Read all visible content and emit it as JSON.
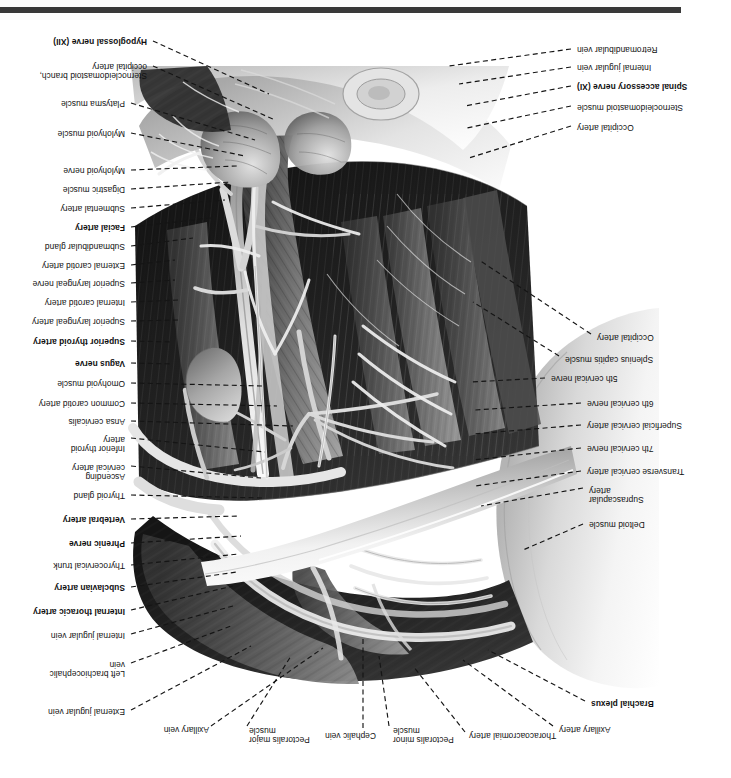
{
  "plate": {
    "title": "Root of the neck and cervical region dissection",
    "orientation": "rotated-180",
    "footer_rule_color": "#3a3a3a",
    "background_color": "#ffffff",
    "leader_line_color": "#151515"
  },
  "labels_left": [
    {
      "text": "Brachial plexus",
      "bold": true,
      "x": 48,
      "y": 70,
      "w": 92,
      "lx1": 146,
      "ly1": 77,
      "lx2": 243,
      "ly2": 128
    },
    {
      "text": "Axillary artery",
      "bold": false,
      "x": 88,
      "y": 44,
      "w": 84,
      "lx1": 178,
      "ly1": 52,
      "lx2": 268,
      "ly2": 118
    },
    {
      "text": "Thoracoacromial artery",
      "bold": false,
      "x": 140,
      "y": 38,
      "w": 122,
      "lx1": 266,
      "ly1": 46,
      "lx2": 318,
      "ly2": 112
    },
    {
      "text": "Pectoralis minor\nmuscle",
      "bold": false,
      "x": 262,
      "y": 34,
      "w": 76,
      "lx1": 342,
      "ly1": 52,
      "lx2": 352,
      "ly2": 122
    },
    {
      "text": "Cephalic vein",
      "bold": false,
      "x": 330,
      "y": 38,
      "w": 76,
      "lx1": 368,
      "ly1": 50,
      "lx2": 368,
      "ly2": 140
    },
    {
      "text": "Pectoralis major\nmuscle",
      "bold": false,
      "x": 396,
      "y": 34,
      "w": 86,
      "lx1": 484,
      "ly1": 52,
      "lx2": 440,
      "ly2": 122
    },
    {
      "text": "Deltoid muscle",
      "bold": false,
      "x": 56,
      "y": 249,
      "w": 86,
      "lx1": 148,
      "ly1": 254,
      "lx2": 208,
      "ly2": 228
    },
    {
      "text": "Suprascapular\nartery",
      "bold": false,
      "x": 60,
      "y": 274,
      "w": 82,
      "lx1": 148,
      "ly1": 290,
      "lx2": 250,
      "ly2": 272
    },
    {
      "text": "Transverse cervical artery",
      "bold": false,
      "x": 28,
      "y": 302,
      "w": 116,
      "lx1": 150,
      "ly1": 307,
      "lx2": 256,
      "ly2": 292
    },
    {
      "text": "7th cervical nerve",
      "bold": false,
      "x": 56,
      "y": 325,
      "w": 88,
      "lx1": 150,
      "ly1": 330,
      "lx2": 258,
      "ly2": 318
    },
    {
      "text": "Superficial cervical artery",
      "bold": false,
      "x": 32,
      "y": 348,
      "w": 112,
      "lx1": 150,
      "ly1": 353,
      "lx2": 258,
      "ly2": 344
    },
    {
      "text": "6th cervical nerve",
      "bold": false,
      "x": 56,
      "y": 370,
      "w": 88,
      "lx1": 150,
      "ly1": 375,
      "lx2": 256,
      "ly2": 368
    },
    {
      "text": "5th cervical nerve",
      "bold": false,
      "x": 92,
      "y": 395,
      "w": 88,
      "lx1": 186,
      "ly1": 400,
      "lx2": 260,
      "ly2": 396
    },
    {
      "text": "Splenius capitis muscle",
      "bold": false,
      "x": 48,
      "y": 414,
      "w": 118,
      "lx1": 172,
      "ly1": 422,
      "lx2": 258,
      "ly2": 476
    },
    {
      "text": "Occipital artery",
      "bold": false,
      "x": 42,
      "y": 436,
      "w": 92,
      "lx1": 140,
      "ly1": 444,
      "lx2": 252,
      "ly2": 518
    },
    {
      "text": "Occipital artery",
      "bold": false,
      "x": 62,
      "y": 646,
      "w": 92,
      "lx1": 160,
      "ly1": 652,
      "lx2": 262,
      "ly2": 620
    },
    {
      "text": "Sternocleidomastoid muscle",
      "bold": false,
      "x": 26,
      "y": 666,
      "w": 128,
      "lx1": 160,
      "ly1": 672,
      "lx2": 264,
      "ly2": 650
    },
    {
      "text": "Spinal accessory nerve (XI)",
      "bold": true,
      "x": 32,
      "y": 687,
      "w": 122,
      "lx1": 160,
      "ly1": 692,
      "lx2": 266,
      "ly2": 672
    },
    {
      "text": "Internal jugular vein",
      "bold": false,
      "x": 58,
      "y": 706,
      "w": 96,
      "lx1": 160,
      "ly1": 711,
      "lx2": 272,
      "ly2": 694
    },
    {
      "text": "Retromandibular vein",
      "bold": false,
      "x": 40,
      "y": 724,
      "w": 114,
      "lx1": 160,
      "ly1": 729,
      "lx2": 282,
      "ly2": 712
    }
  ],
  "labels_right": [
    {
      "text": "Axillary vein",
      "bold": false,
      "x": 522,
      "y": 44,
      "w": 78,
      "lx1": 520,
      "ly1": 52,
      "lx2": 408,
      "ly2": 130
    },
    {
      "text": "External jugular vein",
      "bold": false,
      "x": 606,
      "y": 62,
      "w": 110,
      "lx1": 600,
      "ly1": 68,
      "lx2": 480,
      "ly2": 132
    },
    {
      "text": "Left brachiocephalic\nvein",
      "bold": false,
      "x": 606,
      "y": 100,
      "w": 104,
      "lx1": 600,
      "ly1": 115,
      "lx2": 500,
      "ly2": 152
    },
    {
      "text": "Internal jugular vein",
      "bold": false,
      "x": 606,
      "y": 138,
      "w": 102,
      "lx1": 600,
      "ly1": 144,
      "lx2": 498,
      "ly2": 172
    },
    {
      "text": "Internal thoracic artery",
      "bold": true,
      "x": 606,
      "y": 162,
      "w": 112,
      "lx1": 600,
      "ly1": 168,
      "lx2": 498,
      "ly2": 192
    },
    {
      "text": "Subclavian artery",
      "bold": true,
      "x": 606,
      "y": 186,
      "w": 102,
      "lx1": 600,
      "ly1": 191,
      "lx2": 494,
      "ly2": 206
    },
    {
      "text": "Thyrocervical trunk",
      "bold": false,
      "x": 606,
      "y": 208,
      "w": 102,
      "lx1": 600,
      "ly1": 213,
      "lx2": 492,
      "ly2": 224
    },
    {
      "text": "Phrenic nerve",
      "bold": true,
      "x": 606,
      "y": 230,
      "w": 90,
      "lx1": 600,
      "ly1": 235,
      "lx2": 490,
      "ly2": 242
    },
    {
      "text": "Vertebral artery",
      "bold": true,
      "x": 606,
      "y": 254,
      "w": 94,
      "lx1": 600,
      "ly1": 259,
      "lx2": 492,
      "ly2": 262
    },
    {
      "text": "Thyroid gland",
      "bold": false,
      "x": 606,
      "y": 278,
      "w": 88,
      "lx1": 600,
      "ly1": 283,
      "lx2": 468,
      "ly2": 280
    },
    {
      "text": "Ascending\ncervical artery",
      "bold": false,
      "x": 606,
      "y": 297,
      "w": 92,
      "lx1": 600,
      "ly1": 312,
      "lx2": 470,
      "ly2": 300
    },
    {
      "text": "Inferior thyroid\nartery",
      "bold": false,
      "x": 606,
      "y": 325,
      "w": 88,
      "lx1": 600,
      "ly1": 340,
      "lx2": 466,
      "ly2": 326
    },
    {
      "text": "Ansa cervicalis",
      "bold": false,
      "x": 606,
      "y": 352,
      "w": 90,
      "lx1": 600,
      "ly1": 357,
      "lx2": 438,
      "ly2": 352
    },
    {
      "text": "Common carotid artery",
      "bold": false,
      "x": 606,
      "y": 370,
      "w": 116,
      "lx1": 600,
      "ly1": 375,
      "lx2": 454,
      "ly2": 372
    },
    {
      "text": "Omohyoid muscle",
      "bold": false,
      "x": 606,
      "y": 390,
      "w": 102,
      "lx1": 600,
      "ly1": 395,
      "lx2": 468,
      "ly2": 392
    },
    {
      "text": "Vagus nerve",
      "bold": true,
      "x": 606,
      "y": 410,
      "w": 84,
      "lx1": 600,
      "ly1": 415,
      "lx2": 558,
      "ly2": 414
    },
    {
      "text": "Superior thyroid artery",
      "bold": true,
      "x": 606,
      "y": 432,
      "w": 116,
      "lx1": 600,
      "ly1": 437,
      "lx2": 558,
      "ly2": 436
    },
    {
      "text": "Superior laryngeal artery",
      "bold": false,
      "x": 606,
      "y": 452,
      "w": 118,
      "lx1": 600,
      "ly1": 457,
      "lx2": 552,
      "ly2": 458
    },
    {
      "text": "Internal carotid artery",
      "bold": false,
      "x": 606,
      "y": 471,
      "w": 106,
      "lx1": 600,
      "ly1": 476,
      "lx2": 552,
      "ly2": 478
    },
    {
      "text": "Superior laryngeal nerve",
      "bold": false,
      "x": 606,
      "y": 490,
      "w": 118,
      "lx1": 600,
      "ly1": 495,
      "lx2": 556,
      "ly2": 498
    },
    {
      "text": "External carotid artery",
      "bold": false,
      "x": 606,
      "y": 508,
      "w": 112,
      "lx1": 600,
      "ly1": 513,
      "lx2": 556,
      "ly2": 518
    },
    {
      "text": "Submandibular gland",
      "bold": false,
      "x": 606,
      "y": 527,
      "w": 116,
      "lx1": 600,
      "ly1": 532,
      "lx2": 538,
      "ly2": 540
    },
    {
      "text": "Facial artery",
      "bold": true,
      "x": 606,
      "y": 546,
      "w": 82,
      "lx1": 600,
      "ly1": 551,
      "lx2": 520,
      "ly2": 560
    },
    {
      "text": "Submental artery",
      "bold": false,
      "x": 606,
      "y": 565,
      "w": 100,
      "lx1": 600,
      "ly1": 570,
      "lx2": 506,
      "ly2": 578
    },
    {
      "text": "Digastric muscle",
      "bold": false,
      "x": 606,
      "y": 584,
      "w": 94,
      "lx1": 600,
      "ly1": 589,
      "lx2": 500,
      "ly2": 596
    },
    {
      "text": "Mylohyoid nerve",
      "bold": false,
      "x": 606,
      "y": 603,
      "w": 98,
      "lx1": 600,
      "ly1": 608,
      "lx2": 494,
      "ly2": 612
    },
    {
      "text": "Mylohyoid muscle",
      "bold": false,
      "x": 606,
      "y": 640,
      "w": 102,
      "lx1": 600,
      "ly1": 645,
      "lx2": 486,
      "ly2": 622
    },
    {
      "text": "Platysma muscle",
      "bold": false,
      "x": 606,
      "y": 670,
      "w": 98,
      "lx1": 600,
      "ly1": 675,
      "lx2": 476,
      "ly2": 638
    },
    {
      "text": "Sternocleidomastoid branch,\noccipital artery",
      "bold": false,
      "x": 584,
      "y": 698,
      "w": 136,
      "lx1": 578,
      "ly1": 712,
      "lx2": 456,
      "ly2": 658
    },
    {
      "text": "Hypoglossal nerve (XII)",
      "bold": true,
      "x": 584,
      "y": 732,
      "w": 126,
      "lx1": 578,
      "ly1": 737,
      "lx2": 462,
      "ly2": 684
    }
  ]
}
